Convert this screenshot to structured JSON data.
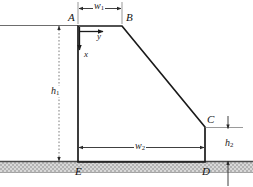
{
  "figure": {
    "kind": "engineering-cross-section-diagram",
    "background_color": "#ffffff",
    "line_color": "#1a1a1a",
    "ground_fill_color": "#c9c9c9",
    "ground_top_line_color": "#555555",
    "dimension_line_color": "#333333"
  },
  "vertices": [
    {
      "id": "A",
      "label": "A",
      "x": 78,
      "y": 26,
      "label_x": 68,
      "label_y": 12
    },
    {
      "id": "B",
      "label": "B",
      "x": 122,
      "y": 26,
      "label_x": 126,
      "label_y": 12
    },
    {
      "id": "C",
      "label": "C",
      "x": 205,
      "y": 127,
      "label_x": 207,
      "label_y": 114
    },
    {
      "id": "D",
      "label": "D",
      "x": 205,
      "y": 162,
      "label_x": 202,
      "label_y": 166
    },
    {
      "id": "E",
      "label": "E",
      "x": 78,
      "y": 162,
      "label_x": 75,
      "label_y": 166
    }
  ],
  "dimensions": [
    {
      "id": "w1",
      "label": "w",
      "subscript": "1",
      "orientation": "horizontal",
      "label_x": 93,
      "label_y": 2
    },
    {
      "id": "h1",
      "label": "h",
      "subscript": "1",
      "orientation": "vertical",
      "label_x": 50,
      "label_y": 86
    },
    {
      "id": "w2",
      "label": "w",
      "subscript": "2",
      "orientation": "horizontal",
      "label_x": 134,
      "label_y": 141
    },
    {
      "id": "h2",
      "label": "h",
      "subscript": "2",
      "orientation": "vertical",
      "label_x": 224,
      "label_y": 138
    }
  ],
  "axes": [
    {
      "id": "y-axis",
      "label": "y",
      "direction": "right",
      "label_x": 97,
      "label_y": 32
    },
    {
      "id": "x-axis",
      "label": "x",
      "direction": "down",
      "label_x": 84,
      "label_y": 52
    }
  ]
}
